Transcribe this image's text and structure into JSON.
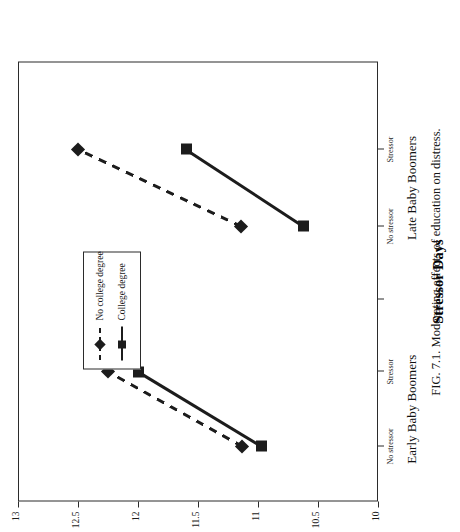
{
  "figure": {
    "caption": "FIG. 7.1.   Moderating effects of education on distress.",
    "caption_number": "FIG. 7.1.",
    "caption_text": "Moderating effects of education on distress.",
    "orientation": "rotated-90-landscape"
  },
  "legend": {
    "position": "inside-plot-left",
    "entries": [
      {
        "label": "No college degree",
        "marker": "diamond",
        "line": "dashed",
        "color": "#1c1c1c"
      },
      {
        "label": "College degree",
        "marker": "square",
        "line": "solid",
        "color": "#1c1c1c"
      }
    ]
  },
  "axes": {
    "x_title": "Stressor Days",
    "x_tick_labels": [
      "No stressor",
      "Stressor",
      "No stressor",
      "Stressor"
    ],
    "group_labels": [
      "Early Baby Boomers",
      "Late Baby Boomers"
    ],
    "y_tick_labels": [
      "13",
      "12.5",
      "12",
      "11.5",
      "11",
      "10.5",
      "10"
    ],
    "y_min": 10,
    "y_max": 13,
    "y_inverted": true,
    "grid": false
  },
  "chart_data": {
    "type": "line",
    "title": "",
    "subtitle": "",
    "xlabel": "Stressor Days",
    "ylabel": "",
    "ylim": [
      10,
      13
    ],
    "y_inverted": true,
    "grid": false,
    "legend_position": "inside-left",
    "categories": [
      "No stressor",
      "Stressor",
      "No stressor",
      "Stressor"
    ],
    "groups": [
      "Early Baby Boomers",
      "Late Baby Boomers"
    ],
    "annotations": [
      "FIG. 7.1.   Moderating effects of education on distress."
    ],
    "series": [
      {
        "name": "No college degree",
        "marker": "diamond",
        "line": "dashed",
        "color": "#1c1c1c",
        "values": [
          11.13,
          12.25,
          11.14,
          12.5
        ],
        "points": [
          {
            "group": "Early Baby Boomers",
            "category": "No stressor",
            "value": 11.13
          },
          {
            "group": "Early Baby Boomers",
            "category": "Stressor",
            "value": 12.25
          },
          {
            "group": "Late Baby Boomers",
            "category": "No stressor",
            "value": 11.14
          },
          {
            "group": "Late Baby Boomers",
            "category": "Stressor",
            "value": 12.5
          }
        ]
      },
      {
        "name": "College degree",
        "marker": "square",
        "line": "solid",
        "color": "#1c1c1c",
        "values": [
          10.97,
          12.0,
          10.62,
          11.6
        ],
        "points": [
          {
            "group": "Early Baby Boomers",
            "category": "No stressor",
            "value": 10.97
          },
          {
            "group": "Early Baby Boomers",
            "category": "Stressor",
            "value": 12.0
          },
          {
            "group": "Late Baby Boomers",
            "category": "No stressor",
            "value": 10.62
          },
          {
            "group": "Late Baby Boomers",
            "category": "Stressor",
            "value": 11.6
          }
        ]
      }
    ]
  }
}
